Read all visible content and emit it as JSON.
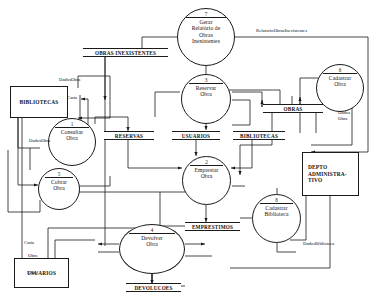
{
  "diagram": {
    "type": "data-flow-diagram",
    "colors": {
      "stroke": "#1a1a1a",
      "background": "#ffffff",
      "text": "#111111"
    }
  },
  "processes": [
    {
      "id": "p1",
      "number": "1",
      "label": "Consultar\nObra",
      "line1": "Consultar",
      "line2": "Obra"
    },
    {
      "id": "p2",
      "number": "2",
      "label": "Emprestar\nObra",
      "line1": "Emprestar",
      "line2": "Obra"
    },
    {
      "id": "p3",
      "number": "3",
      "label": "Reservar\nObra",
      "line1": "Reservar",
      "line2": "Obra"
    },
    {
      "id": "p4",
      "number": "4",
      "label": "Devolver\nObra",
      "line1": "Devolver",
      "line2": "Obra"
    },
    {
      "id": "p5",
      "number": "5",
      "label": "Cobrar\nObra",
      "line1": "Cobrar",
      "line2": "Obra"
    },
    {
      "id": "p6",
      "number": "6",
      "label": "Cadastrar\nObra",
      "line1": "Cadastrar",
      "line2": "Obra"
    },
    {
      "id": "p7",
      "number": "7",
      "label": "Gerar Relatorio de Obras Inexistentes",
      "line1": "Gerar",
      "line2": "Relatório de",
      "line3": "Obras",
      "line4": "Inexistentes"
    },
    {
      "id": "p8",
      "number": "8",
      "label": "Cadastrar\nBiblioteca",
      "line1": "Cadastrar",
      "line2": "Biblioteca"
    }
  ],
  "entities": [
    {
      "id": "e1",
      "label": "BIBLIOTECAS"
    },
    {
      "id": "e2",
      "label": "USUARIOS"
    },
    {
      "id": "e3",
      "line1": "DEPTO",
      "line2": "ADMINISTRA-",
      "line3": "TIVO",
      "label": "DEPTO ADMINISTRATIVO"
    }
  ],
  "datastores": [
    {
      "id": "ds1",
      "label": "OBRAS INEXISTENTES"
    },
    {
      "id": "ds2",
      "label": "RESERVAS"
    },
    {
      "id": "ds3",
      "label": "USUARIOS"
    },
    {
      "id": "ds4",
      "label": "BIBLIOTECAS"
    },
    {
      "id": "ds5",
      "label": "OBRAS"
    },
    {
      "id": "ds6",
      "label": "EMPRESTIMOS"
    },
    {
      "id": "ds7",
      "label": "DEVOLUCOES"
    }
  ],
  "flows": [
    {
      "id": "f1",
      "label": "RelatorioObrasInexistentes"
    },
    {
      "id": "f2",
      "label": "DadosObra"
    },
    {
      "id": "f3",
      "label": "Carta"
    },
    {
      "id": "f4",
      "label": "DadosObra"
    },
    {
      "id": "f5",
      "label": "Dados Obra",
      "line1": "Dados",
      "line2": "Obra"
    },
    {
      "id": "f6",
      "label": "Carta"
    },
    {
      "id": "f7",
      "label": "Obra"
    },
    {
      "id": "f8",
      "label": "Obra"
    },
    {
      "id": "f9",
      "label": "DadosBiblioteca"
    }
  ]
}
